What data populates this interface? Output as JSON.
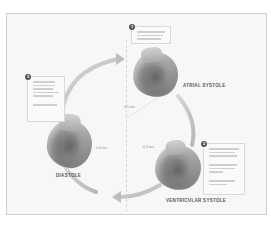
{
  "diagram": {
    "phases": [
      {
        "id": "atrial-systole",
        "label": "ATRIAL SYSTOLE",
        "step": "1"
      },
      {
        "id": "ventricular-systole",
        "label": "VENTRICULAR SYSTOLE",
        "step": "2"
      },
      {
        "id": "diastole",
        "label": "DIASTOLE",
        "step": "3"
      }
    ],
    "time_labels": [
      "0.1 sec",
      "0.3 sec",
      "0.4 sec"
    ],
    "colors": {
      "background": "#ffffff",
      "panel": "#f7f7f7",
      "arrow": "#c4c4c4",
      "heart": "#8a8a8a",
      "label": "#555555"
    }
  }
}
